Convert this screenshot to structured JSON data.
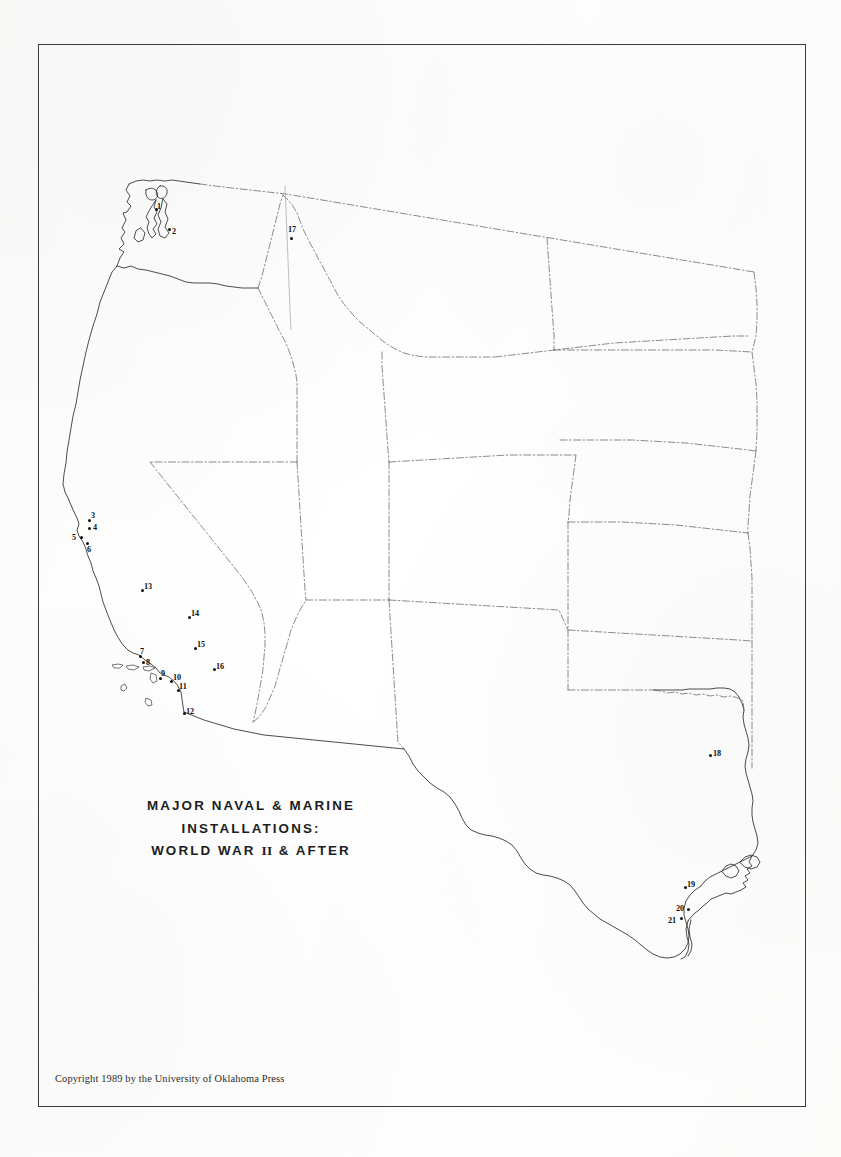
{
  "document": {
    "kind": "printed-map-plate",
    "title_lines": [
      "MAJOR NAVAL & MARINE",
      "INSTALLATIONS:",
      "WORLD WAR"
    ],
    "title_line3_prefix": "WORLD WAR ",
    "title_line3_roman": "II",
    "title_line3_suffix": " & AFTER",
    "copyright": "Copyright 1989 by the University of Oklahoma Press"
  },
  "map": {
    "region": "Western United States",
    "frame_color": "#3a3a3a",
    "coast_color": "#2a2a2a",
    "state_border_color": "#555555",
    "marker_color": "#101010",
    "markers": [
      {
        "id": 1,
        "label": "1",
        "dot_x": 155,
        "dot_y": 208,
        "label_x": 157,
        "label_y": 203
      },
      {
        "id": 2,
        "label": "2",
        "dot_x": 168,
        "dot_y": 228,
        "label_x": 172,
        "label_y": 228
      },
      {
        "id": 3,
        "label": "3",
        "dot_x": 88,
        "dot_y": 519,
        "label_x": 91,
        "label_y": 512
      },
      {
        "id": 4,
        "label": "4",
        "dot_x": 88,
        "dot_y": 527,
        "label_x": 93,
        "label_y": 524
      },
      {
        "id": 5,
        "label": "5",
        "dot_x": 80,
        "dot_y": 536,
        "label_x": 72,
        "label_y": 534
      },
      {
        "id": 6,
        "label": "6",
        "dot_x": 86,
        "dot_y": 542,
        "label_x": 87,
        "label_y": 546
      },
      {
        "id": 7,
        "label": "7",
        "dot_x": 139,
        "dot_y": 655,
        "label_x": 140,
        "label_y": 648
      },
      {
        "id": 8,
        "label": "8",
        "dot_x": 142,
        "dot_y": 661,
        "label_x": 146,
        "label_y": 659
      },
      {
        "id": 9,
        "label": "9",
        "dot_x": 159,
        "dot_y": 677,
        "label_x": 161,
        "label_y": 670
      },
      {
        "id": 10,
        "label": "10",
        "dot_x": 170,
        "dot_y": 680,
        "label_x": 173,
        "label_y": 674
      },
      {
        "id": 11,
        "label": "11",
        "dot_x": 177,
        "dot_y": 689,
        "label_x": 179,
        "label_y": 683
      },
      {
        "id": 12,
        "label": "12",
        "dot_x": 183,
        "dot_y": 712,
        "label_x": 186,
        "label_y": 708
      },
      {
        "id": 13,
        "label": "13",
        "dot_x": 141,
        "dot_y": 589,
        "label_x": 144,
        "label_y": 583
      },
      {
        "id": 14,
        "label": "14",
        "dot_x": 188,
        "dot_y": 616,
        "label_x": 191,
        "label_y": 610
      },
      {
        "id": 15,
        "label": "15",
        "dot_x": 194,
        "dot_y": 647,
        "label_x": 197,
        "label_y": 641
      },
      {
        "id": 16,
        "label": "16",
        "dot_x": 213,
        "dot_y": 668,
        "label_x": 216,
        "label_y": 663
      },
      {
        "id": 17,
        "label": "17",
        "dot_x": 290,
        "dot_y": 237,
        "label_x": 288,
        "label_y": 226
      },
      {
        "id": 18,
        "label": "18",
        "dot_x": 709,
        "dot_y": 754,
        "label_x": 713,
        "label_y": 750
      },
      {
        "id": 19,
        "label": "19",
        "dot_x": 684,
        "dot_y": 886,
        "label_x": 687,
        "label_y": 881
      },
      {
        "id": 20,
        "label": "20",
        "dot_x": 687,
        "dot_y": 908,
        "label_x": 676,
        "label_y": 905
      },
      {
        "id": 21,
        "label": "21",
        "dot_x": 680,
        "dot_y": 917,
        "label_x": 668,
        "label_y": 917
      }
    ]
  }
}
